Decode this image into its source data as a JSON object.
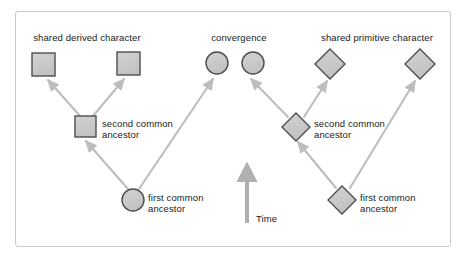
{
  "diagram": {
    "title_labels": {
      "shared_derived": "shared derived character",
      "convergence": "convergence",
      "shared_primitive": "shared primitive character"
    },
    "node_labels": {
      "second_common_left": "second common\nancestor",
      "first_common_left": "first common\nancestor",
      "second_common_right": "second common\nancestor",
      "first_common_right": "first common\nancestor"
    },
    "axis": {
      "time_label": "Time"
    },
    "colors": {
      "node_fill": "#c8c8c8",
      "node_stroke": "#4d4d4d",
      "arrow": "#bdbdbd",
      "time_arrow": "#b0b0b0",
      "frame_border": "#c9c9c9",
      "text": "#1a1a1a",
      "background": "#ffffff"
    },
    "nodes": [
      {
        "id": "left-tip-1",
        "shape": "square",
        "cx": 43.5,
        "cy": 64.5,
        "size": 23
      },
      {
        "id": "left-tip-2",
        "shape": "square",
        "cx": 128.5,
        "cy": 63.5,
        "size": 23
      },
      {
        "id": "left-second-ancestor",
        "shape": "square",
        "cx": 85.5,
        "cy": 126.5,
        "size": 21
      },
      {
        "id": "left-first-ancestor",
        "shape": "circle",
        "cx": 133,
        "cy": 200,
        "size": 22
      },
      {
        "id": "mid-convergence-circle-1",
        "shape": "circle",
        "cx": 217,
        "cy": 63,
        "size": 22
      },
      {
        "id": "mid-convergence-circle-2",
        "shape": "circle",
        "cx": 253,
        "cy": 63,
        "size": 22
      },
      {
        "id": "right-tip-1",
        "shape": "diamond",
        "cx": 330,
        "cy": 64,
        "size": 30
      },
      {
        "id": "right-tip-2",
        "shape": "diamond",
        "cx": 420,
        "cy": 64,
        "size": 30
      },
      {
        "id": "right-second-ancestor",
        "shape": "diamond",
        "cx": 296,
        "cy": 127,
        "size": 28
      },
      {
        "id": "right-first-ancestor",
        "shape": "diamond",
        "cx": 342,
        "cy": 200,
        "size": 28
      }
    ],
    "edges": [
      {
        "id": "edge-left-second-to-tip1",
        "from": [
          80,
          116
        ],
        "to": [
          48,
          80
        ]
      },
      {
        "id": "edge-left-second-to-tip2",
        "from": [
          93,
          116
        ],
        "to": [
          124,
          79
        ]
      },
      {
        "id": "edge-left-first-to-second",
        "from": [
          128,
          189
        ],
        "to": [
          86,
          141
        ]
      },
      {
        "id": "edge-left-first-to-mid-circle1",
        "from": [
          139,
          189
        ],
        "to": [
          213,
          79
        ]
      },
      {
        "id": "edge-right-second-to-midcircle2",
        "from": [
          288,
          117
        ],
        "to": [
          251,
          79
        ]
      },
      {
        "id": "edge-right-second-to-tip1",
        "from": [
          304,
          117
        ],
        "to": [
          327,
          81
        ]
      },
      {
        "id": "edge-right-first-to-second",
        "from": [
          336,
          188
        ],
        "to": [
          298,
          142
        ]
      },
      {
        "id": "edge-right-first-to-tip2",
        "from": [
          350,
          188
        ],
        "to": [
          415,
          81
        ]
      }
    ]
  }
}
